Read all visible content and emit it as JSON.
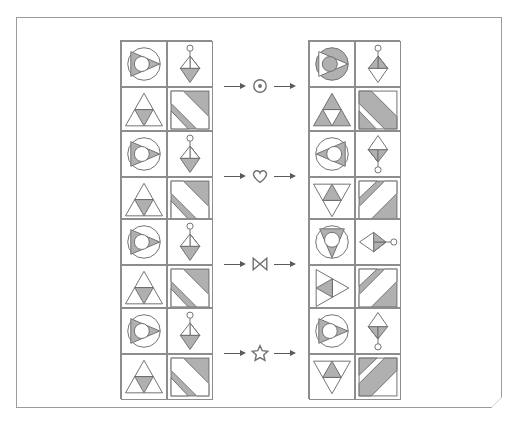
{
  "page": {
    "background_color": "#ffffff",
    "sheet_border_color": "#9b9b9b",
    "fold_corner_color": "#4a4a4a"
  },
  "style": {
    "stroke_color": "#6f6f6f",
    "fill_gray": "#b0b0b0",
    "fill_white": "#ffffff",
    "grid_border_color": "#8d8d8d",
    "arrow_color": "#5a5a5a"
  },
  "rows": [
    {
      "index": 1,
      "operator": {
        "name": "circled-dot-operator",
        "glyph": "⊙",
        "label": "circled dot"
      },
      "arrow_left": "→",
      "arrow_right": "→",
      "input_grid": {
        "name": "input-grid-row-1",
        "cells": [
          {
            "position": "top-left",
            "icon": "circle-with-right-triangle-and-inner-circle",
            "orientation": "right",
            "shading": "triangle-gray"
          },
          {
            "position": "top-right",
            "icon": "pendant-rhombus-with-circle-top",
            "orientation": "up",
            "shading": "lower-half-gray"
          },
          {
            "position": "bottom-left",
            "icon": "triangle-with-inner-inverted-triangle",
            "orientation": "up",
            "shading": "inner-gray"
          },
          {
            "position": "bottom-right",
            "icon": "square-with-diagonal-band",
            "orientation": "nw-se",
            "shading": "corners-gray"
          }
        ]
      },
      "output_grid": {
        "name": "output-grid-row-1",
        "cells": [
          {
            "position": "top-left",
            "icon": "circle-with-right-triangle-and-inner-circle",
            "orientation": "right",
            "shading": "circle-gray-inverted"
          },
          {
            "position": "top-right",
            "icon": "pendant-rhombus-with-circle-top",
            "orientation": "up",
            "shading": "upper-half-gray"
          },
          {
            "position": "bottom-left",
            "icon": "triangle-with-inner-inverted-triangle",
            "orientation": "up",
            "shading": "outer-gray"
          },
          {
            "position": "bottom-right",
            "icon": "square-with-diagonal-band",
            "orientation": "nw-se",
            "shading": "band-gray"
          }
        ]
      }
    },
    {
      "index": 2,
      "operator": {
        "name": "heart-operator",
        "glyph": "♡",
        "label": "heart"
      },
      "arrow_left": "→",
      "arrow_right": "→",
      "input_grid": {
        "name": "input-grid-row-2",
        "cells": [
          {
            "position": "top-left",
            "icon": "circle-with-right-triangle-and-inner-circle",
            "orientation": "right",
            "shading": "triangle-gray"
          },
          {
            "position": "top-right",
            "icon": "pendant-rhombus-with-circle-top",
            "orientation": "up",
            "shading": "lower-half-gray"
          },
          {
            "position": "bottom-left",
            "icon": "triangle-with-inner-inverted-triangle",
            "orientation": "up",
            "shading": "inner-gray"
          },
          {
            "position": "bottom-right",
            "icon": "square-with-diagonal-band",
            "orientation": "nw-se",
            "shading": "corners-gray"
          }
        ]
      },
      "output_grid": {
        "name": "output-grid-row-2",
        "cells": [
          {
            "position": "top-left",
            "icon": "circle-with-right-triangle-and-inner-circle",
            "orientation": "left",
            "shading": "triangle-gray"
          },
          {
            "position": "top-right",
            "icon": "pendant-rhombus-with-circle-top",
            "orientation": "down",
            "shading": "upper-half-gray"
          },
          {
            "position": "bottom-left",
            "icon": "triangle-with-inner-inverted-triangle",
            "orientation": "down",
            "shading": "inner-gray"
          },
          {
            "position": "bottom-right",
            "icon": "square-with-diagonal-band",
            "orientation": "ne-sw",
            "shading": "corners-gray"
          }
        ]
      }
    },
    {
      "index": 3,
      "operator": {
        "name": "bowtie-operator",
        "glyph": "⋈",
        "label": "bowtie"
      },
      "arrow_left": "→",
      "arrow_right": "→",
      "input_grid": {
        "name": "input-grid-row-3",
        "cells": [
          {
            "position": "top-left",
            "icon": "circle-with-right-triangle-and-inner-circle",
            "orientation": "right",
            "shading": "triangle-gray"
          },
          {
            "position": "top-right",
            "icon": "pendant-rhombus-with-circle-top",
            "orientation": "up",
            "shading": "lower-half-gray"
          },
          {
            "position": "bottom-left",
            "icon": "triangle-with-inner-inverted-triangle",
            "orientation": "up",
            "shading": "inner-gray"
          },
          {
            "position": "bottom-right",
            "icon": "square-with-diagonal-band",
            "orientation": "nw-se",
            "shading": "corners-gray"
          }
        ]
      },
      "output_grid": {
        "name": "output-grid-row-3",
        "cells": [
          {
            "position": "top-left",
            "icon": "circle-with-right-triangle-and-inner-circle",
            "orientation": "down",
            "shading": "triangle-gray"
          },
          {
            "position": "top-right",
            "icon": "pendant-rhombus-with-circle-top",
            "orientation": "right",
            "shading": "left-half-gray"
          },
          {
            "position": "bottom-left",
            "icon": "triangle-with-inner-inverted-triangle",
            "orientation": "right",
            "shading": "inner-gray"
          },
          {
            "position": "bottom-right",
            "icon": "square-with-diagonal-band",
            "orientation": "ne-sw",
            "shading": "corners-gray"
          }
        ]
      }
    },
    {
      "index": 4,
      "operator": {
        "name": "star-operator",
        "glyph": "☆",
        "label": "star"
      },
      "arrow_left": "→",
      "arrow_right": "→",
      "input_grid": {
        "name": "input-grid-row-4",
        "cells": [
          {
            "position": "top-left",
            "icon": "circle-with-right-triangle-and-inner-circle",
            "orientation": "right",
            "shading": "triangle-gray"
          },
          {
            "position": "top-right",
            "icon": "pendant-rhombus-with-circle-top",
            "orientation": "up",
            "shading": "lower-half-gray"
          },
          {
            "position": "bottom-left",
            "icon": "triangle-with-inner-inverted-triangle",
            "orientation": "up",
            "shading": "inner-gray"
          },
          {
            "position": "bottom-right",
            "icon": "square-with-diagonal-band",
            "orientation": "nw-se",
            "shading": "corners-gray"
          }
        ]
      },
      "output_grid": {
        "name": "output-grid-row-4",
        "cells": [
          {
            "position": "top-left",
            "icon": "circle-with-right-triangle-and-inner-circle",
            "orientation": "right",
            "shading": "triangle-gray"
          },
          {
            "position": "top-right",
            "icon": "pendant-rhombus-with-circle-top",
            "orientation": "down",
            "shading": "upper-half-gray"
          },
          {
            "position": "bottom-left",
            "icon": "triangle-with-inner-inverted-triangle",
            "orientation": "down",
            "shading": "inner-gray"
          },
          {
            "position": "bottom-right",
            "icon": "square-with-diagonal-band",
            "orientation": "ne-sw",
            "shading": "band-gray"
          }
        ]
      }
    }
  ]
}
